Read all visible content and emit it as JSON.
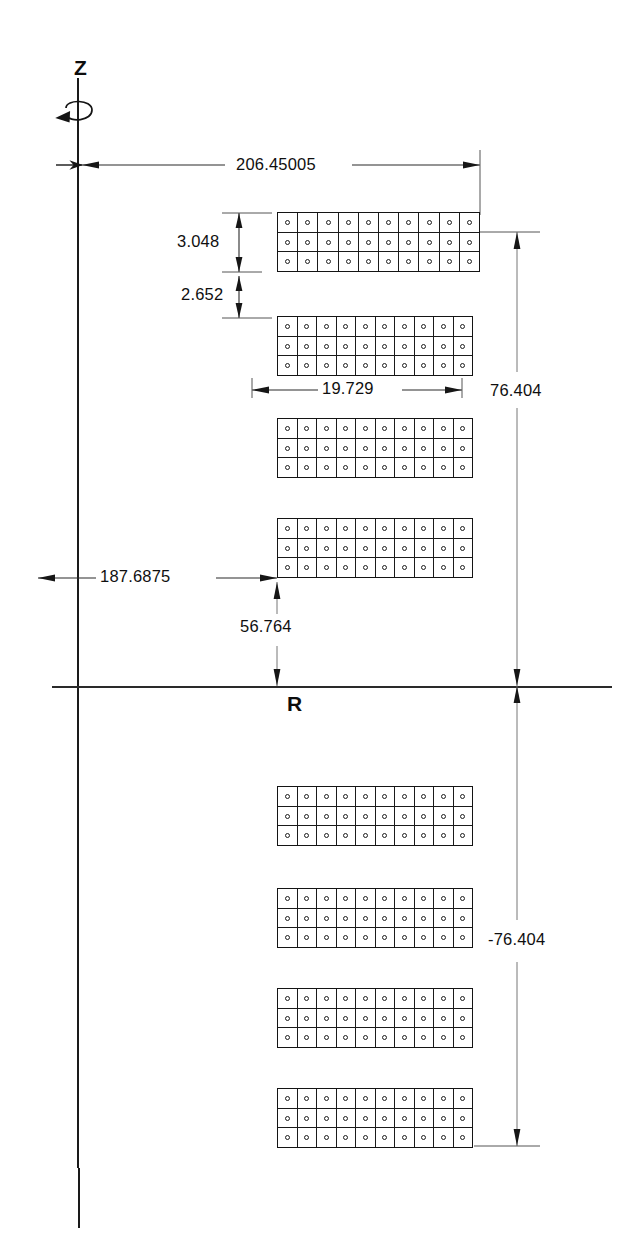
{
  "drawing": {
    "type": "reactor-core-rz-cross-section",
    "axes": {
      "vertical_label": "Z",
      "horizontal_label": "R",
      "rotation_symbol": "rotation-arrow"
    },
    "dimensions": [
      {
        "id": "radial-outer",
        "value": "206.45005",
        "orientation": "horizontal",
        "position": "top"
      },
      {
        "id": "axial-height",
        "value": "3.048",
        "orientation": "vertical",
        "position": "upper-left"
      },
      {
        "id": "axial-gap",
        "value": "2.652",
        "orientation": "vertical",
        "position": "upper-left"
      },
      {
        "id": "assembly-width",
        "value": "19.729",
        "orientation": "horizontal",
        "position": "middle"
      },
      {
        "id": "axial-top",
        "value": "76.404",
        "orientation": "vertical",
        "position": "right-upper"
      },
      {
        "id": "radial-inner",
        "value": "187.6875",
        "orientation": "horizontal",
        "position": "lower-left"
      },
      {
        "id": "axial-offset",
        "value": "56.764",
        "orientation": "vertical",
        "position": "center-left"
      },
      {
        "id": "axial-bottom",
        "value": "-76.404",
        "orientation": "vertical",
        "position": "right-lower"
      }
    ],
    "assemblies": {
      "columns": 10,
      "rows": 3,
      "count": 8,
      "pin_symbol": "fuel-pin-circle",
      "blocks": [
        {
          "id": "block-upper-1",
          "side": "upper",
          "index": 1,
          "x": 277,
          "y": 212,
          "w": 203,
          "h": 60
        },
        {
          "id": "block-upper-2",
          "side": "upper",
          "index": 2,
          "x": 277,
          "y": 316,
          "w": 196,
          "h": 60
        },
        {
          "id": "block-upper-3",
          "side": "upper",
          "index": 3,
          "x": 277,
          "y": 418,
          "w": 196,
          "h": 60
        },
        {
          "id": "block-upper-4",
          "side": "upper",
          "index": 4,
          "x": 277,
          "y": 518,
          "w": 196,
          "h": 60
        },
        {
          "id": "block-lower-1",
          "side": "lower",
          "index": 5,
          "x": 277,
          "y": 786,
          "w": 196,
          "h": 60
        },
        {
          "id": "block-lower-2",
          "side": "lower",
          "index": 6,
          "x": 277,
          "y": 888,
          "w": 196,
          "h": 60
        },
        {
          "id": "block-lower-3",
          "side": "lower",
          "index": 7,
          "x": 277,
          "y": 988,
          "w": 196,
          "h": 60
        },
        {
          "id": "block-lower-4",
          "side": "lower",
          "index": 8,
          "x": 277,
          "y": 1088,
          "w": 196,
          "h": 60
        }
      ]
    }
  },
  "chart_data": {
    "type": "table",
    "title": "",
    "xlabel": "R",
    "ylabel": "Z",
    "categories": [
      "206.45005",
      "3.048",
      "2.652",
      "19.729",
      "76.404",
      "187.6875",
      "56.764",
      "-76.404"
    ],
    "values": [
      206.45005,
      3.048,
      2.652,
      19.729,
      76.404,
      187.6875,
      56.764,
      -76.404
    ],
    "grid": false,
    "legend": "none"
  }
}
